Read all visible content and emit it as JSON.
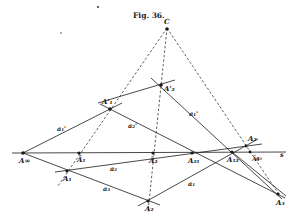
{
  "figure": {
    "caption": "Fig. 36.",
    "ink_color": "#1a1a1a",
    "background": "#ffffff"
  },
  "points": [
    {
      "id": "C",
      "label": "C",
      "x": 167,
      "y": 28
    },
    {
      "id": "A1p",
      "label": "A'₁",
      "x": 110,
      "y": 109
    },
    {
      "id": "A2p",
      "label": "A'₂",
      "x": 161,
      "y": 85
    },
    {
      "id": "Ainf",
      "label": "A∞",
      "x": 23,
      "y": 153
    },
    {
      "id": "A1bar",
      "label": "Ā₁",
      "x": 79,
      "y": 153
    },
    {
      "id": "A2bar",
      "label": "Ā₂",
      "x": 153,
      "y": 153
    },
    {
      "id": "A21",
      "label": "A₂₁",
      "x": 192,
      "y": 153
    },
    {
      "id": "A12",
      "label": "A₁₂",
      "x": 232,
      "y": 152
    },
    {
      "id": "A2s",
      "label": "A₂",
      "x": 248,
      "y": 147
    },
    {
      "id": "A3bar",
      "label": "Ā₃",
      "x": 251,
      "y": 153
    },
    {
      "id": "A1",
      "label": "A₁",
      "x": 67,
      "y": 171
    },
    {
      "id": "A2",
      "label": "A₂",
      "x": 148,
      "y": 201
    },
    {
      "id": "A3",
      "label": "A₃",
      "x": 278,
      "y": 194
    }
  ],
  "line_labels": [
    {
      "label": "a₁'",
      "x": 57,
      "y": 131
    },
    {
      "label": "a₂'",
      "x": 128,
      "y": 128
    },
    {
      "label": "a₁'",
      "x": 189,
      "y": 116
    },
    {
      "label": "a₂",
      "x": 110,
      "y": 171
    },
    {
      "label": "a₃",
      "x": 103,
      "y": 191
    },
    {
      "label": "a₁",
      "x": 188,
      "y": 186
    },
    {
      "label": "a₃",
      "x": 256,
      "y": 160
    },
    {
      "label": "s",
      "x": 281,
      "y": 157
    }
  ]
}
